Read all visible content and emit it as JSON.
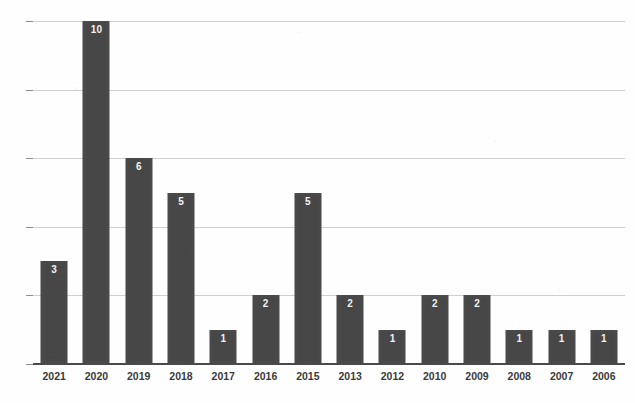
{
  "chart_data": {
    "type": "bar",
    "title": "",
    "subtitle": "",
    "xlabel": "",
    "ylabel": "",
    "categories": [
      "2021",
      "2020",
      "2019",
      "2018",
      "2017",
      "2016",
      "2015",
      "2013",
      "2012",
      "2010",
      "2009",
      "2008",
      "2007",
      "2006"
    ],
    "values": [
      3,
      10,
      6,
      5,
      1,
      2,
      5,
      2,
      1,
      2,
      2,
      1,
      1,
      1
    ],
    "data_labels": [
      "3",
      "10",
      "6",
      "5",
      "1",
      "2",
      "5",
      "2",
      "1",
      "2",
      "2",
      "1",
      "1",
      "1"
    ],
    "ylim": [
      0,
      10
    ],
    "ytick_values": [
      0,
      2,
      4,
      6,
      8,
      10
    ],
    "ytick_labels": [
      "0",
      "2",
      "4",
      "6",
      "8",
      "10"
    ],
    "grid": true,
    "grid_axis": "y",
    "legend": false,
    "legend_position": "none",
    "orientation": "vertical",
    "bar_color": "#474747",
    "data_label_color": "#f2f2f2",
    "gridline_color": "#cfcfcf",
    "axis_color": "#4a4a4a",
    "background_color": "#fefefe",
    "annotations": []
  }
}
